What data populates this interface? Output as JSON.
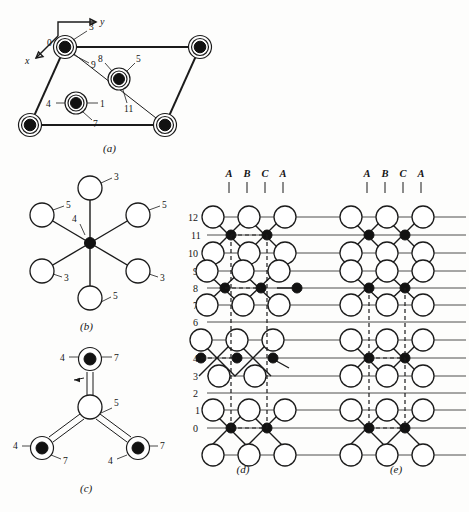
{
  "figure": {
    "background": "#fdfdfc",
    "ink": "#1b1b1b"
  },
  "panel_a": {
    "caption": "(a)",
    "axis": {
      "x_label": "x",
      "y_label": "y"
    },
    "corner_atoms": [
      {
        "cx": 65,
        "cy": 47,
        "label_left": "0",
        "label_ur": "3",
        "label_lr": "9"
      },
      {
        "cx": 200,
        "cy": 47
      },
      {
        "cx": 30,
        "cy": 125
      },
      {
        "cx": 165,
        "cy": 125
      }
    ],
    "interior_atoms": [
      {
        "cx": 119,
        "cy": 77,
        "label_ul": "8",
        "label_ur": "5",
        "label_br": "11"
      },
      {
        "cx": 76,
        "cy": 103,
        "label_l": "4",
        "label_r": "1",
        "label_br": "7"
      }
    ],
    "labels": [
      "0",
      "3",
      "9",
      "8",
      "5",
      "11",
      "4",
      "1",
      "7"
    ]
  },
  "panel_b": {
    "caption": "(b)",
    "center_label": "4",
    "neighbors": [
      {
        "position": "top",
        "label": "3"
      },
      {
        "position": "upper-left",
        "label": "5"
      },
      {
        "position": "upper-right",
        "label": "5"
      },
      {
        "position": "lower-left",
        "label": "3"
      },
      {
        "position": "lower-right",
        "label": "3"
      },
      {
        "position": "bottom",
        "label": "5"
      }
    ]
  },
  "panel_c": {
    "caption": "(c)",
    "center_label": "5",
    "branches": [
      {
        "position": "top",
        "label_left": "4",
        "label_right": "7"
      },
      {
        "position": "bottom-left",
        "label_left": "4",
        "label_right": "7"
      },
      {
        "position": "bottom-right",
        "label_left": "4",
        "label_right": "7"
      }
    ]
  },
  "panel_d": {
    "caption": "(d)",
    "stacking_header": [
      "A",
      "B",
      "C",
      "A"
    ],
    "row_numbers": [
      "12",
      "11",
      "10",
      "9",
      "8",
      "7",
      "6",
      "5",
      "4",
      "3",
      "2",
      "1",
      "0"
    ],
    "stacking_type": "ABCA rhombohedral (shifted layers)"
  },
  "panel_e": {
    "caption": "(e)",
    "stacking_header": [
      "A",
      "B",
      "C",
      "A"
    ],
    "stacking_type": "aligned layers"
  },
  "shared": {
    "row_numbers": [
      "12",
      "11",
      "10",
      "9",
      "8",
      "7",
      "6",
      "5",
      "4",
      "3",
      "2",
      "1",
      "0"
    ],
    "stacking_header": [
      "A",
      "B",
      "C",
      "A"
    ]
  }
}
